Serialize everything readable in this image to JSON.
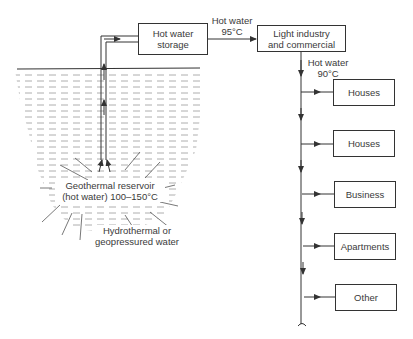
{
  "diagram": {
    "storage_box": {
      "line1": "Hot water",
      "line2": "storage"
    },
    "flow_label_1": {
      "line1": "Hot water",
      "line2": "95°C"
    },
    "industry_box": {
      "line1": "Light industry",
      "line2": "and commercial"
    },
    "flow_label_2": {
      "line1": "Hot water",
      "line2": "90°C"
    },
    "consumers": [
      {
        "label": "Houses"
      },
      {
        "label": "Houses"
      },
      {
        "label": "Business"
      },
      {
        "label": "Apartments"
      },
      {
        "label": "Other"
      }
    ],
    "reservoir_label": {
      "line1": "Geothermal reservoir",
      "line2": "(hot water) 100–150°C"
    },
    "source_label": {
      "line1": "Hydrothermal or",
      "line2": "geopressured water"
    },
    "colors": {
      "line": "#333333",
      "hatch": "#8a8a8a",
      "background": "#ffffff"
    }
  }
}
